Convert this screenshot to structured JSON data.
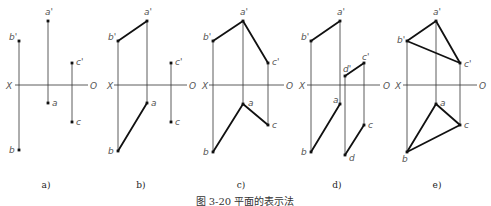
{
  "figure": {
    "caption": "图 3-20  平面的表示法",
    "axis": {
      "left_label": "X",
      "right_label": "O"
    },
    "colors": {
      "thin_line": "#333333",
      "thick_line": "#111111",
      "point": "#111111",
      "label": "#555555"
    },
    "panels": [
      {
        "id": "a",
        "label": "a)",
        "label_pos": [
          46,
          188
        ],
        "axis": {
          "x1": 15,
          "x2": 88,
          "y": 85,
          "X_pos": [
            6,
            89
          ],
          "O_pos": [
            90,
            89
          ]
        },
        "points": [
          {
            "name": "a'",
            "x": 48,
            "y": 21,
            "lx": 45,
            "ly": 15
          },
          {
            "name": "b'",
            "x": 19,
            "y": 41,
            "lx": 9,
            "ly": 40
          },
          {
            "name": "c'",
            "x": 72,
            "y": 63,
            "lx": 76,
            "ly": 65
          },
          {
            "name": "a",
            "x": 48,
            "y": 103,
            "lx": 52,
            "ly": 106
          },
          {
            "name": "b",
            "x": 19,
            "y": 150,
            "lx": 9,
            "ly": 153
          },
          {
            "name": "c",
            "x": 72,
            "y": 122,
            "lx": 76,
            "ly": 125
          }
        ],
        "projectors": [
          [
            "a'",
            "a"
          ],
          [
            "b'",
            "b"
          ],
          [
            "c'",
            "c"
          ]
        ],
        "edges": []
      },
      {
        "id": "b",
        "label": "b)",
        "label_pos": [
          141,
          188
        ],
        "axis": {
          "x1": 114,
          "x2": 187,
          "y": 85,
          "X_pos": [
            107,
            89
          ],
          "O_pos": [
            189,
            89
          ]
        },
        "points": [
          {
            "name": "a'",
            "x": 147,
            "y": 21,
            "lx": 144,
            "ly": 15
          },
          {
            "name": "b'",
            "x": 118,
            "y": 41,
            "lx": 108,
            "ly": 40
          },
          {
            "name": "c'",
            "x": 171,
            "y": 63,
            "lx": 175,
            "ly": 65
          },
          {
            "name": "a",
            "x": 147,
            "y": 103,
            "lx": 151,
            "ly": 106
          },
          {
            "name": "b",
            "x": 118,
            "y": 151,
            "lx": 108,
            "ly": 154
          },
          {
            "name": "c",
            "x": 171,
            "y": 122,
            "lx": 175,
            "ly": 125
          }
        ],
        "projectors": [
          [
            "a'",
            "a"
          ],
          [
            "b'",
            "b"
          ],
          [
            "c'",
            "c"
          ]
        ],
        "edges": [
          [
            "a'",
            "b'"
          ],
          [
            "a",
            "b"
          ]
        ]
      },
      {
        "id": "c",
        "label": "c)",
        "label_pos": [
          241,
          188
        ],
        "axis": {
          "x1": 209,
          "x2": 284,
          "y": 85,
          "X_pos": [
            202,
            89
          ],
          "O_pos": [
            286,
            89
          ]
        },
        "points": [
          {
            "name": "a'",
            "x": 243,
            "y": 21,
            "lx": 240,
            "ly": 15
          },
          {
            "name": "b'",
            "x": 213,
            "y": 41,
            "lx": 203,
            "ly": 40
          },
          {
            "name": "c'",
            "x": 268,
            "y": 63,
            "lx": 272,
            "ly": 65
          },
          {
            "name": "a",
            "x": 243,
            "y": 104,
            "lx": 248,
            "ly": 106
          },
          {
            "name": "b",
            "x": 213,
            "y": 152,
            "lx": 203,
            "ly": 155
          },
          {
            "name": "c",
            "x": 268,
            "y": 125,
            "lx": 272,
            "ly": 128
          }
        ],
        "projectors": [
          [
            "a'",
            "a"
          ],
          [
            "b'",
            "b"
          ],
          [
            "c'",
            "c"
          ]
        ],
        "edges": [
          [
            "a'",
            "b'"
          ],
          [
            "a'",
            "c'"
          ],
          [
            "a",
            "b"
          ],
          [
            "a",
            "c"
          ]
        ]
      },
      {
        "id": "d",
        "label": "d)",
        "label_pos": [
          337,
          188
        ],
        "axis": {
          "x1": 307,
          "x2": 380,
          "y": 85,
          "X_pos": [
            299,
            89
          ],
          "O_pos": [
            383,
            89
          ]
        },
        "points": [
          {
            "name": "a'",
            "x": 340,
            "y": 21,
            "lx": 337,
            "ly": 15
          },
          {
            "name": "b'",
            "x": 311,
            "y": 41,
            "lx": 301,
            "ly": 40
          },
          {
            "name": "c'",
            "x": 364,
            "y": 63,
            "lx": 362,
            "ly": 60
          },
          {
            "name": "d'",
            "x": 345,
            "y": 76,
            "lx": 343,
            "ly": 72
          },
          {
            "name": "a",
            "x": 340,
            "y": 104,
            "lx": 333,
            "ly": 103
          },
          {
            "name": "b",
            "x": 311,
            "y": 152,
            "lx": 301,
            "ly": 155
          },
          {
            "name": "c",
            "x": 364,
            "y": 125,
            "lx": 368,
            "ly": 128
          },
          {
            "name": "d",
            "x": 345,
            "y": 155,
            "lx": 349,
            "ly": 161
          }
        ],
        "projectors": [
          [
            "a'",
            "a"
          ],
          [
            "b'",
            "b"
          ],
          [
            "c'",
            "c"
          ],
          [
            "d'",
            "d"
          ]
        ],
        "edges": [
          [
            "a'",
            "b'"
          ],
          [
            "c'",
            "d'"
          ],
          [
            "a",
            "b"
          ],
          [
            "c",
            "d"
          ]
        ]
      },
      {
        "id": "e",
        "label": "e)",
        "label_pos": [
          437,
          188
        ],
        "axis": {
          "x1": 403,
          "x2": 477,
          "y": 85,
          "X_pos": [
            395,
            89
          ],
          "O_pos": [
            479,
            89
          ]
        },
        "points": [
          {
            "name": "a'",
            "x": 436,
            "y": 21,
            "lx": 433,
            "ly": 15
          },
          {
            "name": "b'",
            "x": 407,
            "y": 41,
            "lx": 397,
            "ly": 43
          },
          {
            "name": "c'",
            "x": 460,
            "y": 63,
            "lx": 464,
            "ly": 67
          },
          {
            "name": "a",
            "x": 436,
            "y": 104,
            "lx": 440,
            "ly": 106
          },
          {
            "name": "b",
            "x": 407,
            "y": 152,
            "lx": 402,
            "ly": 162
          },
          {
            "name": "c",
            "x": 460,
            "y": 125,
            "lx": 464,
            "ly": 128
          }
        ],
        "projectors": [
          [
            "a'",
            "a"
          ],
          [
            "b'",
            "b"
          ],
          [
            "c'",
            "c"
          ]
        ],
        "edges": [
          [
            "a'",
            "b'"
          ],
          [
            "b'",
            "c'"
          ],
          [
            "a'",
            "c'"
          ],
          [
            "a",
            "b"
          ],
          [
            "b",
            "c"
          ],
          [
            "a",
            "c"
          ]
        ]
      }
    ]
  }
}
